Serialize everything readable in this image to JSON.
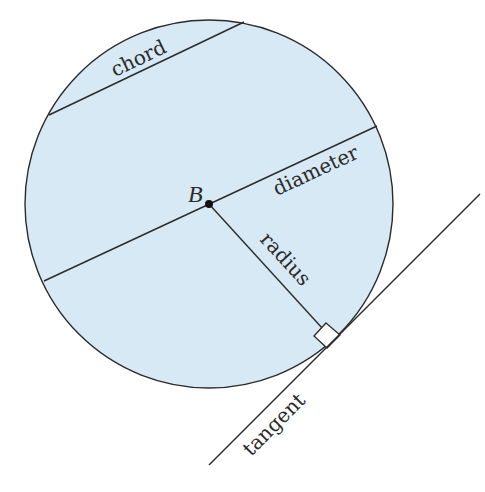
{
  "diagram": {
    "colors": {
      "circle_fill": "#d6e9f5",
      "stroke": "#2b2b2b",
      "background": "#ffffff"
    },
    "center": {
      "label": "B",
      "x": 209,
      "y": 204
    },
    "circle": {
      "r": 184
    },
    "labels": {
      "chord": "chord",
      "diameter": "diameter",
      "radius": "radius",
      "tangent": "tangent",
      "center": "B"
    }
  }
}
